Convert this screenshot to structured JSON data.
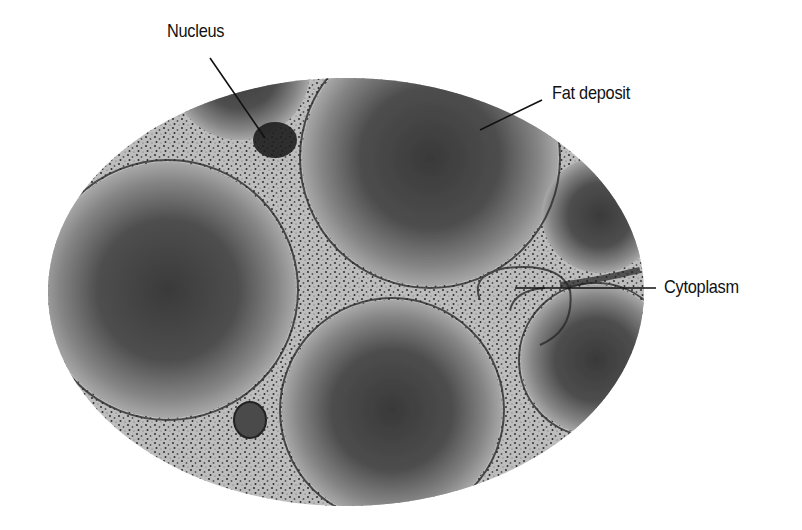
{
  "figure": {
    "type": "micrograph",
    "labels": [
      {
        "id": "nucleus",
        "text": "Nucleus"
      },
      {
        "id": "fat-deposit",
        "text": "Fat deposit"
      },
      {
        "id": "cytoplasm",
        "text": "Cytoplasm"
      }
    ],
    "colors": {
      "background": "#ffffff",
      "cytoplasm": "#b9b9b9",
      "fat_deposit_center": "#3c3c3c",
      "fat_deposit_edge": "#9a9a9a",
      "membrane": "#2a2a2a",
      "leader_line": "#111111"
    }
  }
}
